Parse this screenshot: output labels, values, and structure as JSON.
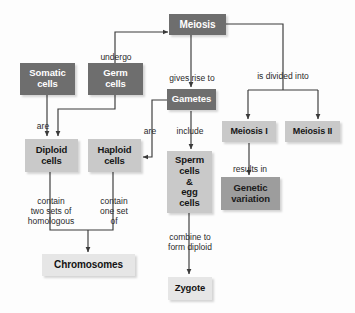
{
  "diagram": {
    "background_color": "#fdfdfd",
    "colors": {
      "dark_box": "#6e6e6e",
      "mid_box": "#9d9d9d",
      "light_box": "#c9c9c9",
      "pale_box": "#e6e6e6",
      "connector": "#3a3a3a",
      "dark_box_text": "#ffffff",
      "light_box_text": "#161616"
    },
    "nodes": [
      {
        "id": "meiosis",
        "label": "Meiosis"
      },
      {
        "id": "somatic",
        "label": "Somatic\ncells"
      },
      {
        "id": "germ",
        "label": "Germ\ncells"
      },
      {
        "id": "gametes",
        "label": "Gametes"
      },
      {
        "id": "meiosis1",
        "label": "Meiosis I"
      },
      {
        "id": "meiosis2",
        "label": "Meiosis II"
      },
      {
        "id": "diploid",
        "label": "Diploid\ncells"
      },
      {
        "id": "haploid",
        "label": "Haploid\ncells"
      },
      {
        "id": "sperm_egg",
        "label": "Sperm\ncells\n&\negg\ncells"
      },
      {
        "id": "genetic",
        "label": "Genetic\nvariation"
      },
      {
        "id": "chromosomes",
        "label": "Chromosomes"
      },
      {
        "id": "zygote",
        "label": "Zygote"
      }
    ],
    "edge_labels": [
      {
        "id": "undergo",
        "text": "undergo"
      },
      {
        "id": "gives_rise_to",
        "text": "gives rise to"
      },
      {
        "id": "is_divided_into",
        "text": "is divided into"
      },
      {
        "id": "are_left",
        "text": "are"
      },
      {
        "id": "are_right",
        "text": "are"
      },
      {
        "id": "include",
        "text": "include"
      },
      {
        "id": "results_in",
        "text": "results in"
      },
      {
        "id": "contain_two",
        "text": "contain\ntwo sets of\nhomologous"
      },
      {
        "id": "contain_one",
        "text": "contain\none set\nof"
      },
      {
        "id": "combine",
        "text": "combine to\nform diploid"
      }
    ]
  }
}
